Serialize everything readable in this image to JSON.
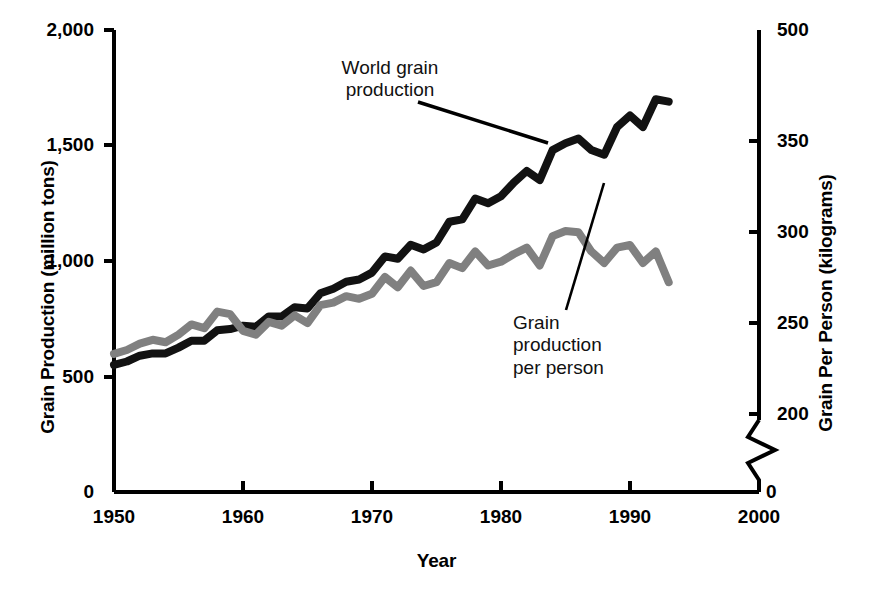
{
  "chart_data": {
    "type": "line",
    "title": "",
    "xlabel": "Year",
    "ylabel": "Grain Production (million tons)",
    "ylabel_right": "Grain Per Person (kilograms)",
    "xlim": [
      1950,
      2000
    ],
    "ylim": [
      0,
      2000
    ],
    "ylim_right": [
      0,
      500
    ],
    "right_axis_break": true,
    "right_axis_break_between": [
      0,
      200
    ],
    "grid": false,
    "legend": "annotations-on-plot",
    "xticks": [
      "1950",
      "1960",
      "1970",
      "1980",
      "1990",
      "2000"
    ],
    "xtick_values": [
      1950,
      1960,
      1970,
      1980,
      1990,
      2000
    ],
    "yticks_left": [
      "0",
      "500",
      "1,000",
      "1,500",
      "2,000"
    ],
    "ytick_values_left": [
      0,
      500,
      1000,
      1500,
      2000
    ],
    "yticks_right": [
      "0",
      "200",
      "250",
      "300",
      "350",
      "500"
    ],
    "ytick_values_right": [
      0,
      200,
      250,
      300,
      350,
      500
    ],
    "origin_label_left": "0",
    "origin_label_right": "0",
    "annotations": [
      {
        "name": "world-grain-production",
        "text": "World grain\nproduction",
        "points_to": "black-series"
      },
      {
        "name": "grain-production-per-person",
        "text": "Grain\nproduction\nper person",
        "points_to": "gray-series"
      }
    ],
    "series": [
      {
        "name": "World grain production",
        "axis": "left",
        "color": "#121212",
        "unit": "million tons",
        "x": [
          1950,
          1951,
          1952,
          1953,
          1954,
          1955,
          1956,
          1957,
          1958,
          1959,
          1960,
          1961,
          1962,
          1963,
          1964,
          1965,
          1966,
          1967,
          1968,
          1969,
          1970,
          1971,
          1972,
          1973,
          1974,
          1975,
          1976,
          1977,
          1978,
          1979,
          1980,
          1981,
          1982,
          1983,
          1984,
          1985,
          1986,
          1987,
          1988,
          1989,
          1990,
          1991,
          1992,
          1993
        ],
        "values": [
          550,
          565,
          590,
          600,
          600,
          625,
          655,
          655,
          700,
          705,
          720,
          715,
          760,
          760,
          800,
          795,
          860,
          880,
          910,
          920,
          950,
          1020,
          1010,
          1070,
          1050,
          1080,
          1170,
          1180,
          1270,
          1250,
          1280,
          1340,
          1390,
          1350,
          1480,
          1510,
          1530,
          1480,
          1460,
          1580,
          1630,
          1580,
          1700,
          1690
        ]
      },
      {
        "name": "Grain production per person",
        "axis": "right",
        "color": "#808080",
        "unit": "kilograms",
        "x": [
          1950,
          1951,
          1952,
          1953,
          1954,
          1955,
          1956,
          1957,
          1958,
          1959,
          1960,
          1961,
          1962,
          1963,
          1964,
          1965,
          1966,
          1967,
          1968,
          1969,
          1970,
          1971,
          1972,
          1973,
          1974,
          1975,
          1976,
          1977,
          1978,
          1979,
          1980,
          1981,
          1982,
          1983,
          1984,
          1985,
          1986,
          1987,
          1988,
          1989,
          1990,
          1991,
          1992,
          1993
        ],
        "values": [
          247,
          250,
          255,
          258,
          256,
          262,
          270,
          267,
          280,
          278,
          265,
          262,
          272,
          269,
          277,
          271,
          285,
          287,
          292,
          290,
          294,
          307,
          299,
          312,
          300,
          303,
          318,
          314,
          327,
          316,
          319,
          325,
          330,
          316,
          339,
          343,
          342,
          327,
          318,
          330,
          332,
          318,
          327,
          303
        ]
      }
    ]
  },
  "axes": {
    "left_title": "Grain Production (million tons)",
    "right_title": "Grain Per Person (kilograms)",
    "x_title": "Year"
  },
  "annotations": {
    "world": "World grain\nproduction",
    "person": "Grain\nproduction\nper person"
  },
  "colors": {
    "black_series": "#121212",
    "gray_series": "#808080",
    "axis": "#000000",
    "background": "#ffffff"
  }
}
